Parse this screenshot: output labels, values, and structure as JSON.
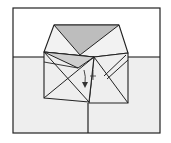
{
  "diagram": {
    "type": "origami-fold-step",
    "colors": {
      "background": "#ffffff",
      "paper_light": "#eeeeee",
      "paper_gray": "#bdbdbd",
      "line": "#222222"
    },
    "arrow": {
      "direction": "down",
      "meaning": "fold-down"
    }
  }
}
